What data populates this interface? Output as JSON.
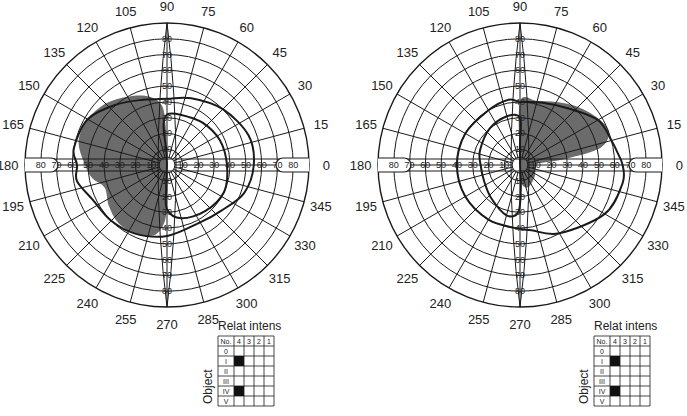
{
  "figure": {
    "fill_color": "#6b6b6b",
    "line_color": "#1a1a1a"
  },
  "chart_data": {
    "type": "polar",
    "angle_labels": [
      "0",
      "15",
      "30",
      "45",
      "60",
      "75",
      "90",
      "105",
      "120",
      "135",
      "150",
      "165",
      "180",
      "195",
      "210",
      "225",
      "240",
      "255",
      "270",
      "285",
      "300",
      "315",
      "330",
      "345"
    ],
    "eccentricity_labels": [
      "10",
      "20",
      "30",
      "40",
      "50",
      "60",
      "70",
      "80"
    ],
    "rings_degrees": [
      5,
      10,
      20,
      30,
      40,
      50,
      60,
      70,
      80,
      90
    ],
    "charts": [
      {
        "id": "left-field",
        "center": [
          167,
          165
        ],
        "shaded_region": "superior-inferior temporal (left half) defect, from ~100° to ~265°, extending to ~60° eccentricity",
        "isopters": [
          "outer isopter (~50–60°)",
          "inner isopter (~30–40°) right half"
        ]
      },
      {
        "id": "right-field",
        "center": [
          520,
          165
        ],
        "shaded_region": "superior nasal (upper-right) defect, from ~90° to ~10°, extending to ~60° eccentricity, plus small central inferior wedge",
        "isopters": [
          "outer isopter (~40–65°)",
          "inner isopter (~20–30°) left half"
        ]
      }
    ]
  },
  "legends": [
    {
      "title": "Relat intens",
      "axis_label": "Object",
      "columns": [
        "No.",
        "4",
        "3",
        "2",
        "1"
      ],
      "rows": [
        "0",
        "I",
        "II",
        "III",
        "IV",
        "V"
      ],
      "filled": [
        [
          "I",
          "4"
        ],
        [
          "IV",
          "4"
        ]
      ]
    },
    {
      "title": "Relat intens",
      "axis_label": "Object",
      "columns": [
        "No.",
        "4",
        "3",
        "2",
        "1"
      ],
      "rows": [
        "0",
        "I",
        "II",
        "III",
        "IV",
        "V"
      ],
      "filled": [
        [
          "I",
          "4"
        ],
        [
          "IV",
          "4"
        ]
      ]
    }
  ]
}
